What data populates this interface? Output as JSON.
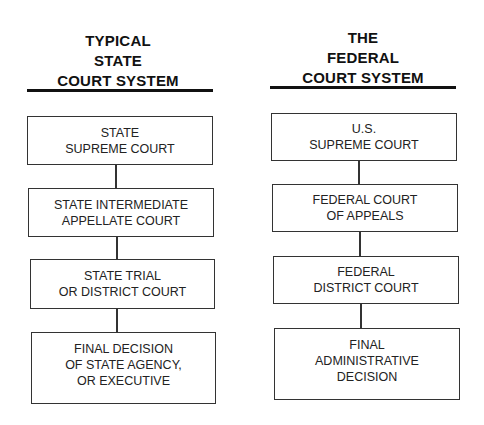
{
  "diagram": {
    "left": {
      "title_lines": [
        "TYPICAL",
        "STATE",
        "COURT SYSTEM"
      ],
      "boxes": [
        {
          "lines": [
            "STATE",
            "SUPREME COURT"
          ]
        },
        {
          "lines": [
            "STATE INTERMEDIATE",
            "APPELLATE COURT"
          ]
        },
        {
          "lines": [
            "STATE TRIAL",
            "OR DISTRICT COURT"
          ]
        },
        {
          "lines": [
            "FINAL DECISION",
            "OF STATE AGENCY,",
            "OR EXECUTIVE"
          ]
        }
      ]
    },
    "right": {
      "title_lines": [
        "THE",
        "FEDERAL",
        "COURT SYSTEM"
      ],
      "boxes": [
        {
          "lines": [
            "U.S.",
            "SUPREME COURT"
          ]
        },
        {
          "lines": [
            "FEDERAL COURT",
            "OF APPEALS"
          ]
        },
        {
          "lines": [
            "FEDERAL",
            "DISTRICT COURT"
          ]
        },
        {
          "lines": [
            "FINAL",
            "ADMINISTRATIVE",
            "DECISION"
          ]
        }
      ]
    }
  }
}
